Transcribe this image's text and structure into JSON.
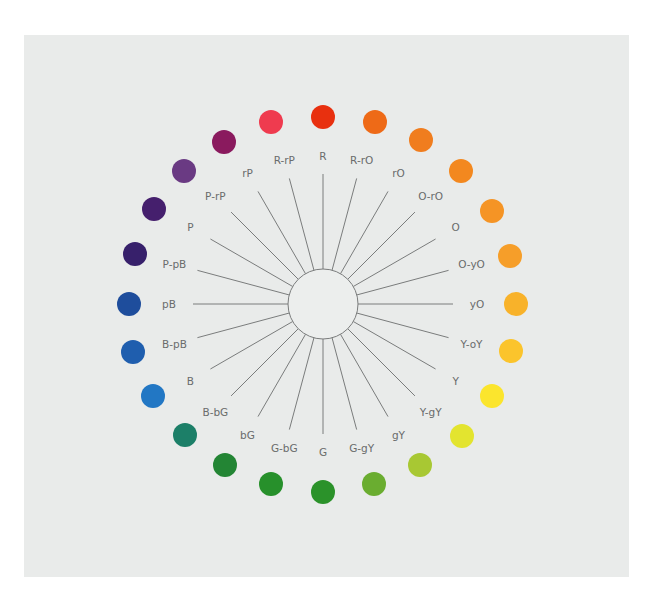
{
  "diagram": {
    "type": "color-wheel",
    "center": {
      "x": 323,
      "y": 304
    },
    "center_circle_radius": 35,
    "spoke_outer_radius": 130,
    "label_radius": 148,
    "line_color": "#7a7c7c",
    "background": "#e9ebea",
    "hues": [
      {
        "label": "R",
        "color": "#e8300f",
        "dot": [
          323,
          117
        ]
      },
      {
        "label": "R-rO",
        "color": "#ee6a17",
        "dot": [
          375,
          122
        ]
      },
      {
        "label": "rO",
        "color": "#f07d1e",
        "dot": [
          421,
          140
        ]
      },
      {
        "label": "O-rO",
        "color": "#f3881f",
        "dot": [
          461,
          171
        ]
      },
      {
        "label": "O",
        "color": "#f59425",
        "dot": [
          492,
          211
        ]
      },
      {
        "label": "O-yO",
        "color": "#f69e29",
        "dot": [
          510,
          256
        ]
      },
      {
        "label": "yO",
        "color": "#f8b22a",
        "dot": [
          516,
          304
        ]
      },
      {
        "label": "Y-oY",
        "color": "#fbc42c",
        "dot": [
          511,
          351
        ]
      },
      {
        "label": "Y",
        "color": "#fbe52d",
        "dot": [
          492,
          396
        ]
      },
      {
        "label": "Y-gY",
        "color": "#e3e42f",
        "dot": [
          462,
          436
        ]
      },
      {
        "label": "gY",
        "color": "#a8c833",
        "dot": [
          420,
          465
        ]
      },
      {
        "label": "G-gY",
        "color": "#6aad30",
        "dot": [
          374,
          484
        ]
      },
      {
        "label": "G",
        "color": "#2b922a",
        "dot": [
          323,
          492
        ]
      },
      {
        "label": "G-bG",
        "color": "#27902b",
        "dot": [
          271,
          484
        ]
      },
      {
        "label": "bG",
        "color": "#238534",
        "dot": [
          225,
          465
        ]
      },
      {
        "label": "B-bG",
        "color": "#1c7f68",
        "dot": [
          185,
          435
        ]
      },
      {
        "label": "B",
        "color": "#2277c4",
        "dot": [
          153,
          396
        ]
      },
      {
        "label": "B-pB",
        "color": "#1f5eae",
        "dot": [
          133,
          352
        ]
      },
      {
        "label": "pB",
        "color": "#1e4d9c",
        "dot": [
          129,
          304
        ]
      },
      {
        "label": "P-pB",
        "color": "#37206b",
        "dot": [
          135,
          254
        ]
      },
      {
        "label": "P",
        "color": "#451f6d",
        "dot": [
          154,
          209
        ]
      },
      {
        "label": "P-rP",
        "color": "#6a3a83",
        "dot": [
          184,
          171
        ]
      },
      {
        "label": "rP",
        "color": "#8a1a5e",
        "dot": [
          224,
          142
        ]
      },
      {
        "label": "R-rP",
        "color": "#ef3b4f",
        "dot": [
          271,
          122
        ]
      }
    ]
  }
}
